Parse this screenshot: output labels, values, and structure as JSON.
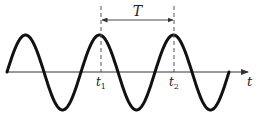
{
  "diagram": {
    "type": "periodic-waveform",
    "colors": {
      "curve": "#111111",
      "axis": "#333333",
      "dashed": "#555555",
      "text": "#222222",
      "background": "#ffffff"
    },
    "axis": {
      "label": "t",
      "y": 72,
      "x_start": 7,
      "x_end": 248
    },
    "wave": {
      "x_start": 7,
      "x_end": 229,
      "baseline_y": 72,
      "amplitude_up": 37,
      "amplitude_down": 38,
      "period_px": 74,
      "cycles": 3
    },
    "markers": [
      {
        "id": "t1",
        "label": "t",
        "sub": "1",
        "x": 101
      },
      {
        "id": "t2",
        "label": "t",
        "sub": "2",
        "x": 174
      }
    ],
    "period": {
      "label": "T",
      "y": 20,
      "x_from": 101,
      "x_to": 174
    }
  }
}
